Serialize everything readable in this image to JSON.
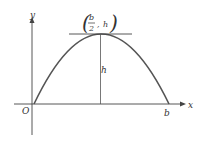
{
  "diagram": {
    "axes": {
      "x_label": "x",
      "y_label": "y",
      "origin_label": "O"
    },
    "curve": {
      "type": "parabola",
      "roots": [
        "0",
        "b"
      ],
      "vertex": {
        "x": "b/2",
        "y": "h"
      }
    },
    "labels": {
      "root_b": "b",
      "height": "h",
      "vertex_num": "b",
      "vertex_den": "2",
      "vertex_sep": ",",
      "vertex_h": "h",
      "paren_open": "(",
      "paren_close": ")"
    },
    "colors": {
      "curve": "#555555",
      "axes": "#444444",
      "text": "#333333"
    }
  }
}
